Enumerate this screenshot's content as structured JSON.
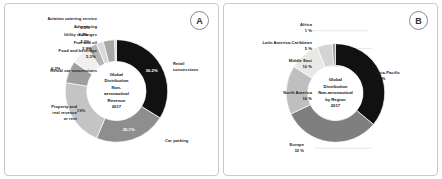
{
  "panels": [
    {
      "badge": "A",
      "center": [
        "Global",
        "Distribution",
        "Non-",
        "aeronautical",
        "Revenue",
        "2017"
      ],
      "labels": {
        "aviation_catering": "Aviation catering service",
        "advertising": "Advertising",
        "utility_recharges": "Utility recharges",
        "fuel_and_oil": "Fuel and oil",
        "food_and_beverage": "Food and beverage",
        "rental_car": "Rental car concessions",
        "property": [
          "Property and",
          "real revenue",
          "or rent"
        ],
        "car_parking": "Car parking",
        "retail": [
          "Retail",
          "concessions"
        ]
      }
    },
    {
      "badge": "B",
      "center": [
        "Global",
        "Distribution",
        "Non-aeronautical",
        "by Region",
        "2017"
      ],
      "labels": {
        "africa": [
          "Africa",
          "1 %"
        ],
        "latam": [
          "Latin America-Caribbean",
          "5 %"
        ],
        "middle_east": [
          "Middle East",
          "10 %"
        ],
        "north_america": [
          "North America",
          "16 %"
        ],
        "europe": [
          "Europe",
          "32 %"
        ],
        "asia_pacific": [
          "Asia-Pacific",
          "36 %"
        ]
      }
    }
  ],
  "chart_data": [
    {
      "type": "pie",
      "title": "Global Distribution Non-aeronautical Revenue 2017",
      "panel": "A",
      "categories": [
        "Retail concessions",
        "Car parking",
        "Property and real revenue or rent",
        "Rental car concessions",
        "Food and beverage",
        "Fuel and oil",
        "Utility recharges",
        "Advertising",
        "Aviation catering service"
      ],
      "values": [
        30.2,
        20.1,
        19.0,
        6.2,
        5.3,
        2.8,
        2.0,
        3.2,
        0.5
      ],
      "value_labels": [
        "30.2%",
        "20.1%",
        "19%",
        "6.2%",
        "5.3%",
        "2.8%",
        "2.0%",
        "3.2%",
        "0.5%"
      ],
      "colors": [
        "#111111",
        "#8e8e8e",
        "#c4c4c4",
        "#9e9e9e",
        "#efefef",
        "#b5b5b5",
        "#d9d9d9",
        "#a8a8a8",
        "#cfcfcf"
      ],
      "xlabel": "",
      "ylabel": "",
      "legend": "callout-labels",
      "grid": false
    },
    {
      "type": "pie",
      "title": "Global Distribution Non-aeronautical by Region 2017",
      "panel": "B",
      "categories": [
        "Asia-Pacific",
        "Europe",
        "North America",
        "Middle East",
        "Latin America-Caribbean",
        "Africa"
      ],
      "values": [
        36,
        32,
        16,
        10,
        5,
        1
      ],
      "value_labels": [
        "36 %",
        "32 %",
        "16 %",
        "10 %",
        "5 %",
        "1 %"
      ],
      "colors": [
        "#111111",
        "#7f7f7f",
        "#bfbfbf",
        "#e8e8e8",
        "#d4d4d4",
        "#9a9a9a"
      ],
      "xlabel": "",
      "ylabel": "",
      "legend": "callout-labels",
      "grid": false
    }
  ]
}
